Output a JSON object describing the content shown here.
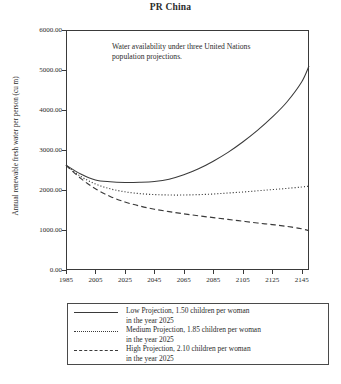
{
  "chart_data": {
    "type": "line",
    "title": "PR China",
    "xlabel": "",
    "ylabel": "Annual renewable fresh water per person (cu m)",
    "xlim": [
      1985,
      2150
    ],
    "ylim": [
      0,
      6000
    ],
    "grid": false,
    "legend_position": "below-plot",
    "annotation": "Water availability under three United Nations population projections.",
    "xticks": [
      1985,
      2005,
      2025,
      2045,
      2065,
      2085,
      2105,
      2125,
      2145
    ],
    "xtick_labels": [
      "1985",
      "2005",
      "2025",
      "2045",
      "2065",
      "2085",
      "2105",
      "2125",
      "2145"
    ],
    "yticks": [
      0,
      1000,
      2000,
      3000,
      4000,
      5000,
      6000
    ],
    "ytick_labels": [
      "0.00",
      "1000.00",
      "2000.00",
      "3000.00",
      "4000.00",
      "5000.00",
      "6000.00"
    ],
    "x": [
      1985,
      1995,
      2005,
      2015,
      2025,
      2035,
      2045,
      2055,
      2065,
      2075,
      2085,
      2095,
      2105,
      2115,
      2125,
      2135,
      2145,
      2150
    ],
    "series": [
      {
        "name": "Low Projection, 1.50 children per woman in the year 2025",
        "style": "solid",
        "color": "#3a3a3a",
        "values": [
          2620,
          2400,
          2250,
          2205,
          2190,
          2195,
          2215,
          2270,
          2380,
          2530,
          2720,
          2940,
          3200,
          3490,
          3820,
          4200,
          4700,
          5100
        ]
      },
      {
        "name": "Medium Projection, 1.85 children per woman in the year 2025",
        "style": "dotted",
        "color": "#3a3a3a",
        "values": [
          2620,
          2340,
          2150,
          2030,
          1955,
          1910,
          1885,
          1875,
          1875,
          1885,
          1900,
          1925,
          1950,
          1980,
          2010,
          2040,
          2075,
          2095
        ]
      },
      {
        "name": "High Projection, 2.10 children per woman in the year 2025",
        "style": "dashed",
        "color": "#3a3a3a",
        "values": [
          2620,
          2290,
          2030,
          1840,
          1700,
          1600,
          1520,
          1460,
          1405,
          1355,
          1310,
          1265,
          1220,
          1175,
          1135,
          1090,
          1030,
          980
        ]
      }
    ]
  },
  "legend": {
    "entries": [
      {
        "line1": "Low Projection, 1.50 children per woman",
        "line2": "in the year 2025",
        "style": "solid"
      },
      {
        "line1": "Medium Projection, 1.85 children per woman",
        "line2": "in the year 2025",
        "style": "dotted"
      },
      {
        "line1": "High Projection, 2.10 children per woman",
        "line2": "in the year 2025",
        "style": "dashed"
      }
    ]
  }
}
